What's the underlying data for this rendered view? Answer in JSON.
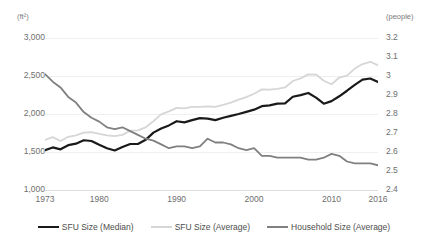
{
  "chart_data": {
    "type": "line",
    "title": "",
    "subtitle": "",
    "xlabel": "",
    "ylabel": "(ft²)",
    "y2label": "(people)",
    "grid": true,
    "legend_position": "bottom",
    "xlim": [
      1973,
      2016
    ],
    "ylim": [
      1000,
      3000
    ],
    "y2lim": [
      2.4,
      3.2
    ],
    "x_ticks": [
      "1973",
      "1980",
      "1990",
      "2000",
      "2010",
      "2016"
    ],
    "x_tick_values": [
      1973,
      1980,
      1990,
      2000,
      2010,
      2016
    ],
    "y_ticks": [
      "3,000",
      "2,500",
      "2,000",
      "1,500",
      "1,000"
    ],
    "y_tick_values": [
      3000,
      2500,
      2000,
      1500,
      1000
    ],
    "y2_ticks": [
      "3.2",
      "3.1",
      "3",
      "2.9",
      "2.8",
      "2.7",
      "2.6",
      "2.5",
      "2.4"
    ],
    "y2_tick_values": [
      3.2,
      3.1,
      3.0,
      2.9,
      2.8,
      2.7,
      2.6,
      2.5,
      2.4
    ],
    "x": [
      1973,
      1974,
      1975,
      1976,
      1977,
      1978,
      1979,
      1980,
      1981,
      1982,
      1983,
      1984,
      1985,
      1986,
      1987,
      1988,
      1989,
      1990,
      1991,
      1992,
      1993,
      1994,
      1995,
      1996,
      1997,
      1998,
      1999,
      2000,
      2001,
      2002,
      2003,
      2004,
      2005,
      2006,
      2007,
      2008,
      2009,
      2010,
      2011,
      2012,
      2013,
      2014,
      2015,
      2016
    ],
    "series": [
      {
        "name": "SFU Size (Median)",
        "axis": "left",
        "units": "ft²",
        "color": "#1a1a1a",
        "values": [
          1525,
          1560,
          1535,
          1590,
          1610,
          1655,
          1645,
          1595,
          1550,
          1520,
          1565,
          1605,
          1605,
          1660,
          1755,
          1810,
          1850,
          1905,
          1890,
          1920,
          1945,
          1940,
          1920,
          1950,
          1975,
          2000,
          2028,
          2057,
          2103,
          2114,
          2137,
          2140,
          2227,
          2248,
          2277,
          2215,
          2135,
          2169,
          2233,
          2306,
          2384,
          2453,
          2467,
          2422
        ],
        "color_name": "near-black"
      },
      {
        "name": "SFU Size (Average)",
        "axis": "left",
        "units": "ft²",
        "color": "#d6d6d6",
        "values": [
          1660,
          1695,
          1645,
          1700,
          1720,
          1755,
          1760,
          1740,
          1720,
          1710,
          1725,
          1780,
          1785,
          1825,
          1905,
          1995,
          2035,
          2080,
          2075,
          2095,
          2095,
          2100,
          2095,
          2120,
          2150,
          2190,
          2223,
          2266,
          2324,
          2320,
          2330,
          2349,
          2434,
          2469,
          2521,
          2519,
          2438,
          2392,
          2480,
          2505,
          2598,
          2657,
          2687,
          2640
        ],
        "color_name": "light-gray"
      },
      {
        "name": "Household Size (Average)",
        "axis": "right",
        "units": "people",
        "color": "#808080",
        "values": [
          3.01,
          2.97,
          2.94,
          2.89,
          2.86,
          2.81,
          2.78,
          2.76,
          2.73,
          2.72,
          2.73,
          2.71,
          2.69,
          2.67,
          2.66,
          2.64,
          2.62,
          2.63,
          2.63,
          2.62,
          2.63,
          2.67,
          2.65,
          2.65,
          2.64,
          2.62,
          2.61,
          2.62,
          2.58,
          2.58,
          2.57,
          2.57,
          2.57,
          2.57,
          2.56,
          2.56,
          2.57,
          2.59,
          2.58,
          2.55,
          2.54,
          2.54,
          2.54,
          2.53
        ],
        "color_name": "medium-gray"
      }
    ]
  }
}
